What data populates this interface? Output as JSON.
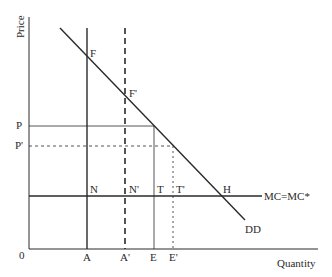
{
  "diagram": {
    "type": "supply-demand-economics",
    "y_axis_label": "Price",
    "x_axis_label": "Quantity",
    "origin_label": "0",
    "price_labels": {
      "p": "P",
      "p_prime": "P'"
    },
    "quantity_labels": {
      "a": "A",
      "a_prime": "A'",
      "e": "E",
      "e_prime": "E'"
    },
    "point_labels": {
      "f": "F",
      "f_prime": "F'",
      "n": "N",
      "n_prime": "N'",
      "t": "T",
      "t_prime": "T'",
      "h": "H"
    },
    "curve_labels": {
      "mc": "MC=MC*",
      "demand": "DD"
    },
    "colors": {
      "line": "#2a2a2a",
      "background": "#ffffff"
    }
  }
}
